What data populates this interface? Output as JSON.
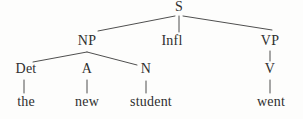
{
  "diagram": {
    "type": "syntax-tree",
    "sentence": "the new student went"
  },
  "nodes": {
    "s": "S",
    "np": "NP",
    "infl": "Infl",
    "vp": "VP",
    "det": "Det",
    "a": "A",
    "n": "N",
    "v": "V"
  },
  "words": {
    "the": "the",
    "new": "new",
    "student": "student",
    "went": "went"
  },
  "edges_drawn": [
    "S-NP",
    "S-Infl",
    "S-VP",
    "NP-Det",
    "NP-N",
    "Det-the",
    "A-new",
    "N-student",
    "VP-V",
    "V-went"
  ],
  "colors": {
    "background": "#fdfdfc",
    "text": "#2f2f2f",
    "line": "#4f4f4f"
  }
}
